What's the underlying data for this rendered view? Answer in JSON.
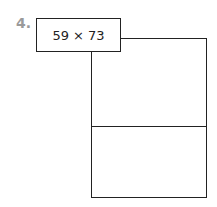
{
  "problem": {
    "number": "4.",
    "expression": "59 × 73",
    "area_model": {
      "rows": 2,
      "columns": 1,
      "cells": [
        "",
        ""
      ]
    }
  }
}
